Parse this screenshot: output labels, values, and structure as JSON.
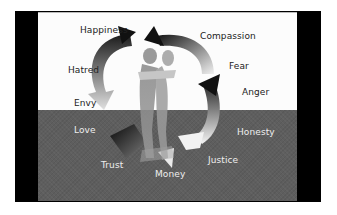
{
  "diagram": {
    "labels_top": [
      {
        "text": "Happiness",
        "x": 42,
        "y": 13
      },
      {
        "text": "Compassion",
        "x": 162,
        "y": 19
      },
      {
        "text": "Hatred",
        "x": 30,
        "y": 53
      },
      {
        "text": "Fear",
        "x": 191,
        "y": 49
      },
      {
        "text": "Envy",
        "x": 36,
        "y": 86
      },
      {
        "text": "Anger",
        "x": 204,
        "y": 75
      }
    ],
    "labels_bottom": [
      {
        "text": "Love",
        "x": 36,
        "y": 112
      },
      {
        "text": "Honesty",
        "x": 199,
        "y": 115
      },
      {
        "text": "Trust",
        "x": 63,
        "y": 148
      },
      {
        "text": "Justice",
        "x": 170,
        "y": 143
      },
      {
        "text": "Money",
        "x": 117,
        "y": 157
      }
    ],
    "icons": {
      "center": "embracing-couple-figure",
      "cycle": "circular-arrows"
    },
    "colors": {
      "frame": "#000000",
      "top_background": "#fcfcfc",
      "bottom_background": "#5e5e5e",
      "label_dark": "#222222",
      "label_light": "#eeeeee"
    }
  }
}
